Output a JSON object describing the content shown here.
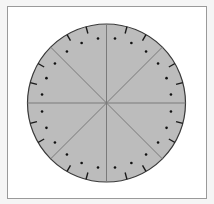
{
  "diagram": {
    "type": "segmented-dial",
    "frame": {
      "x": 7,
      "y": 6,
      "width": 199,
      "height": 192,
      "border_color": "#9a9a9a",
      "background": "#ffffff"
    },
    "circle": {
      "cx": 106.5,
      "cy": 103,
      "r": 79,
      "fill": "#bcbcbc",
      "stroke": "#3a3a3a"
    },
    "radial_lines": {
      "count": 8,
      "angle_step_deg": 45,
      "color": "#7a7a7a"
    },
    "ticks": {
      "angle_step_deg": 15,
      "skip_multiples_of_deg": 45,
      "length": 7,
      "color": "#1a1a1a"
    },
    "dots": {
      "angle_offset_deg": 7.5,
      "angle_step_deg": 15,
      "radius": 65,
      "dot_size": 1.3,
      "color": "#111111"
    }
  }
}
